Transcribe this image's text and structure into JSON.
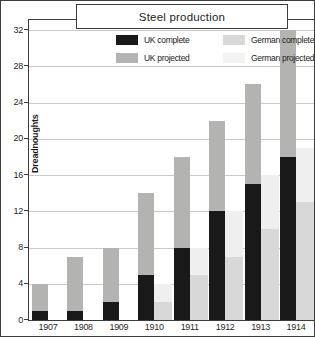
{
  "figure": {
    "title": "Steel production",
    "ylabel": "Dreadnoughts"
  },
  "legend": {
    "items": [
      {
        "label": "UK complete",
        "color": "#191919"
      },
      {
        "label": "UK projected",
        "color": "#b3b3b1"
      },
      {
        "label": "German complete",
        "color": "#d8d8d8"
      },
      {
        "label": "German projected",
        "color": "#f2f2f2"
      }
    ]
  },
  "chart_data": {
    "type": "bar",
    "subtype": "grouped-stacked",
    "title": "Steel production",
    "xlabel": "",
    "ylabel": "Dreadnoughts",
    "categories": [
      "1907",
      "1908",
      "1909",
      "1910",
      "1911",
      "1912",
      "1913",
      "1914"
    ],
    "series": [
      {
        "name": "UK complete",
        "values": [
          1,
          1,
          2,
          5,
          8,
          12,
          15,
          18
        ]
      },
      {
        "name": "UK projected",
        "values": [
          4,
          7,
          8,
          14,
          18,
          22,
          26,
          32
        ]
      },
      {
        "name": "German complete",
        "values": [
          0,
          0,
          0,
          2,
          5,
          7,
          10,
          13
        ]
      },
      {
        "name": "German projected",
        "values": [
          0,
          0,
          0,
          4,
          8,
          12,
          16,
          19
        ]
      }
    ],
    "ylim": [
      0,
      32
    ],
    "yticks": [
      0,
      4,
      8,
      12,
      16,
      20,
      24,
      28,
      32
    ],
    "grid": "horizontal",
    "legend_position": "top-inside",
    "colors": {
      "uk_complete": "#191919",
      "uk_projected": "#b3b3b1",
      "german_complete": "#d8d8d8",
      "german_projected": "#efefef",
      "gridline": "#c9c9c9",
      "frame": "#3c3c3c"
    }
  }
}
